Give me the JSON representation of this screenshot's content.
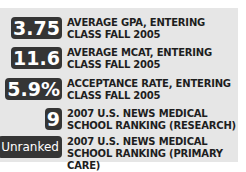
{
  "stats": [
    {
      "value": "3.75",
      "label": "AVERAGE GPA, ENTERING CLASS FALL 2005"
    },
    {
      "value": "11.6",
      "label": "AVERAGE MCAT, ENTERING CLASS FALL 2005"
    },
    {
      "value": "5.9%",
      "label": "ACCEPTANCE RATE, ENTERING CLASS FALL 2005"
    },
    {
      "value": "9",
      "label": "2007 U.S. NEWS MEDICAL SCHOOL RANKING (RESEARCH)"
    },
    {
      "value": "Unranked",
      "label": "2007 U.S. NEWS MEDICAL SCHOOL RANKING (PRIMARY CARE)"
    }
  ],
  "colors": {
    "panel_bg": "#e6e6e6",
    "badge_bg": "#353535",
    "badge_text": "#ffffff",
    "label_text": "#1e1e1e"
  }
}
